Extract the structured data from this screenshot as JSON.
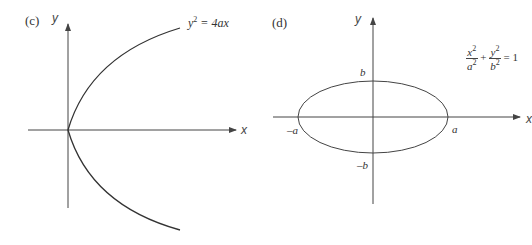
{
  "panels": [
    {
      "id": "c",
      "label": "(c)",
      "y_axis_label": "y",
      "x_axis_label": "x",
      "equation": {
        "lhs": "y",
        "exp": "2",
        "rhs": "= 4ax"
      },
      "curve": "parabola opening right, vertex at origin"
    },
    {
      "id": "d",
      "label": "(d)",
      "y_axis_label": "y",
      "x_axis_label": "x",
      "equation": {
        "t1_num": "x",
        "t1_den": "a",
        "t2_num": "y",
        "t2_den": "b",
        "exp": "2",
        "plus": "+",
        "rhs": "= 1"
      },
      "intercepts": {
        "b": "b",
        "neg_b": "–b",
        "a": "a",
        "neg_a": "–a"
      },
      "curve": "ellipse centered at origin"
    }
  ],
  "colors": {
    "line": "#444444",
    "text": "#333333"
  }
}
